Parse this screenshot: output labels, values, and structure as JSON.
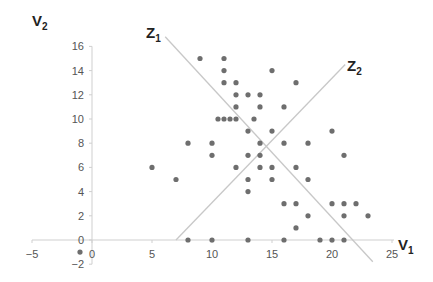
{
  "chart_data": {
    "type": "scatter",
    "title": "",
    "xlabel": "V1",
    "ylabel": "V2",
    "xlabel_main": "V",
    "xlabel_sub": "1",
    "ylabel_main": "V",
    "ylabel_sub": "2",
    "xlim": [
      -5,
      25
    ],
    "ylim": [
      -2,
      16
    ],
    "x_ticks": [
      -5,
      0,
      5,
      10,
      15,
      20,
      25
    ],
    "y_ticks": [
      -2,
      0,
      2,
      4,
      6,
      8,
      10,
      12,
      14,
      16
    ],
    "grid": false,
    "legend": null,
    "point_color": "#6e6e6e",
    "line_color": "#c8c8c8",
    "points": [
      [
        9,
        15
      ],
      [
        11,
        15
      ],
      [
        11,
        14
      ],
      [
        15,
        14
      ],
      [
        11,
        13
      ],
      [
        12,
        13
      ],
      [
        17,
        13
      ],
      [
        12,
        12
      ],
      [
        13,
        12
      ],
      [
        14,
        12
      ],
      [
        12,
        11
      ],
      [
        14,
        11
      ],
      [
        16,
        11
      ],
      [
        10.5,
        10
      ],
      [
        11,
        10
      ],
      [
        11.5,
        10
      ],
      [
        12,
        10
      ],
      [
        13.5,
        10
      ],
      [
        13,
        9
      ],
      [
        15,
        9
      ],
      [
        20,
        9
      ],
      [
        8,
        8
      ],
      [
        10,
        8
      ],
      [
        14,
        8
      ],
      [
        16,
        8
      ],
      [
        18,
        8
      ],
      [
        10,
        7
      ],
      [
        13,
        7
      ],
      [
        14,
        7
      ],
      [
        21,
        7
      ],
      [
        5,
        6
      ],
      [
        12,
        6
      ],
      [
        14,
        6
      ],
      [
        15,
        6
      ],
      [
        17,
        6
      ],
      [
        7,
        5
      ],
      [
        13,
        5
      ],
      [
        15,
        5
      ],
      [
        18,
        5
      ],
      [
        13,
        4
      ],
      [
        16,
        3
      ],
      [
        17,
        3
      ],
      [
        20,
        3
      ],
      [
        21,
        3
      ],
      [
        22,
        3
      ],
      [
        18,
        2
      ],
      [
        21,
        2
      ],
      [
        23,
        2
      ],
      [
        17,
        1
      ],
      [
        8,
        0
      ],
      [
        10,
        0
      ],
      [
        13,
        0
      ],
      [
        16,
        0
      ],
      [
        19,
        0
      ],
      [
        20,
        0
      ],
      [
        21,
        0
      ],
      [
        -1,
        -1
      ]
    ],
    "lines": [
      {
        "name": "Z1",
        "label_main": "Z",
        "label_sub": "1",
        "from": [
          6.1,
          16.8
        ],
        "to": [
          23.4,
          -1.8
        ]
      },
      {
        "name": "Z2",
        "label_main": "Z",
        "label_sub": "2",
        "from": [
          7,
          0
        ],
        "to": [
          21.1,
          14.5
        ]
      }
    ]
  }
}
